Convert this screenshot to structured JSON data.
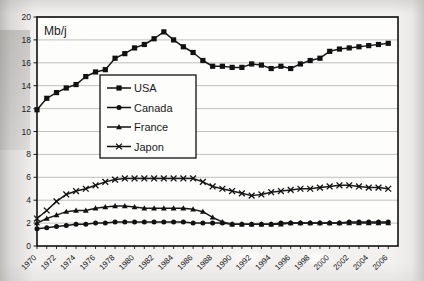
{
  "chart_data": {
    "type": "line",
    "title": "",
    "unit_label": "Mb/j",
    "xlabel": "",
    "ylabel": "",
    "xlim": [
      1970,
      2007
    ],
    "ylim": [
      0,
      20
    ],
    "ytick_step": 2,
    "yticks": [
      0,
      2,
      4,
      6,
      8,
      10,
      12,
      14,
      16,
      18,
      20
    ],
    "xticks": [
      1970,
      1972,
      1974,
      1976,
      1978,
      1980,
      1982,
      1984,
      1986,
      1988,
      1990,
      1992,
      1994,
      1996,
      1998,
      2000,
      2002,
      2004,
      2006
    ],
    "grid": "horizontal",
    "legend_position": "upper-center-left",
    "x": [
      1970,
      1971,
      1972,
      1973,
      1974,
      1975,
      1976,
      1977,
      1978,
      1979,
      1980,
      1981,
      1982,
      1983,
      1984,
      1985,
      1986,
      1987,
      1988,
      1989,
      1990,
      1991,
      1992,
      1993,
      1994,
      1995,
      1996,
      1997,
      1998,
      1999,
      2000,
      2001,
      2002,
      2003,
      2004,
      2005,
      2006
    ],
    "series": [
      {
        "name": "USA",
        "marker": "square",
        "color": "#1a1a1a",
        "values": [
          11.9,
          12.9,
          13.4,
          13.8,
          14.1,
          14.8,
          15.2,
          15.4,
          16.4,
          16.8,
          17.3,
          17.6,
          18.1,
          18.7,
          18.0,
          17.4,
          16.9,
          16.2,
          15.7,
          15.7,
          15.6,
          15.6,
          15.9,
          15.8,
          15.5,
          15.7,
          15.5,
          15.9,
          16.2,
          16.4,
          17.0,
          17.2,
          17.3,
          17.4,
          17.5,
          17.6,
          17.7
        ],
        "peak": {
          "year": 1983,
          "value": 18.7
        },
        "start": {
          "year": 1970,
          "value": 11.9
        },
        "end": {
          "year": 2006,
          "value": 17.7
        }
      },
      {
        "name": "Canada",
        "marker": "circle",
        "color": "#1a1a1a",
        "values": [
          1.5,
          1.6,
          1.7,
          1.8,
          1.9,
          1.9,
          2.0,
          2.0,
          2.1,
          2.1,
          2.1,
          2.1,
          2.1,
          2.1,
          2.1,
          2.1,
          2.0,
          2.0,
          2.0,
          2.0,
          1.9,
          1.9,
          1.9,
          1.9,
          1.9,
          2.0,
          2.0,
          2.0,
          2.0,
          2.0,
          2.0,
          2.0,
          2.1,
          2.1,
          2.1,
          2.1,
          2.1
        ],
        "start": {
          "year": 1970,
          "value": 1.5
        },
        "end": {
          "year": 2006,
          "value": 2.1
        }
      },
      {
        "name": "France",
        "marker": "triangle",
        "color": "#1a1a1a",
        "values": [
          2.0,
          2.4,
          2.7,
          3.0,
          3.1,
          3.1,
          3.3,
          3.4,
          3.5,
          3.5,
          3.4,
          3.3,
          3.3,
          3.3,
          3.3,
          3.3,
          3.2,
          3.0,
          2.5,
          2.1,
          1.9,
          1.9,
          1.9,
          1.9,
          1.9,
          1.9,
          2.0,
          2.0,
          2.0,
          2.0,
          2.0,
          2.0,
          2.0,
          2.0,
          2.0,
          2.0,
          2.0
        ],
        "peak": {
          "year": 1977,
          "value": 3.5
        },
        "start": {
          "year": 1970,
          "value": 2.0
        },
        "end": {
          "year": 2006,
          "value": 2.0
        }
      },
      {
        "name": "Japon",
        "marker": "cross",
        "color": "#1a1a1a",
        "values": [
          2.4,
          3.1,
          3.9,
          4.5,
          4.8,
          5.0,
          5.3,
          5.6,
          5.8,
          5.9,
          5.9,
          5.9,
          5.9,
          5.9,
          5.9,
          5.9,
          5.9,
          5.6,
          5.2,
          5.0,
          4.8,
          4.6,
          4.4,
          4.5,
          4.7,
          4.8,
          4.9,
          5.0,
          5.0,
          5.1,
          5.2,
          5.3,
          5.3,
          5.2,
          5.1,
          5.1,
          5.0
        ],
        "plateau": {
          "years": [
            1979,
            1986
          ],
          "value": 5.9
        },
        "start": {
          "year": 1970,
          "value": 2.4
        },
        "end": {
          "year": 2006,
          "value": 5.0
        }
      }
    ],
    "legend": [
      {
        "label": "USA",
        "marker": "square"
      },
      {
        "label": "Canada",
        "marker": "circle"
      },
      {
        "label": "France",
        "marker": "triangle"
      },
      {
        "label": "Japon",
        "marker": "cross"
      }
    ]
  }
}
